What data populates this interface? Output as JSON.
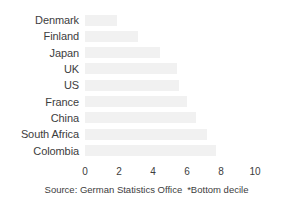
{
  "chart_data": {
    "type": "bar",
    "orientation": "horizontal",
    "title": "",
    "subtitle": "",
    "xlabel": "",
    "ylabel": "",
    "categories": [
      "Denmark",
      "Finland",
      "Japan",
      "UK",
      "US",
      "France",
      "China",
      "South Africa",
      "Colombia"
    ],
    "values": [
      1.9,
      3.1,
      4.4,
      5.4,
      5.5,
      6.0,
      6.5,
      7.2,
      7.7
    ],
    "xticks": [
      0,
      2,
      4,
      6,
      8,
      10
    ],
    "xtick_labels": [
      "0",
      "2",
      "4",
      "6",
      "8",
      "10"
    ],
    "xlim": [
      0,
      11
    ],
    "grid": false,
    "legend": null,
    "bar_color": "#f1f1f1",
    "text_color": "#3d3d3d",
    "background": "#ffffff",
    "annotations": {
      "source": "Source: German Statistics Office",
      "footnote": "*Bottom decile"
    }
  }
}
